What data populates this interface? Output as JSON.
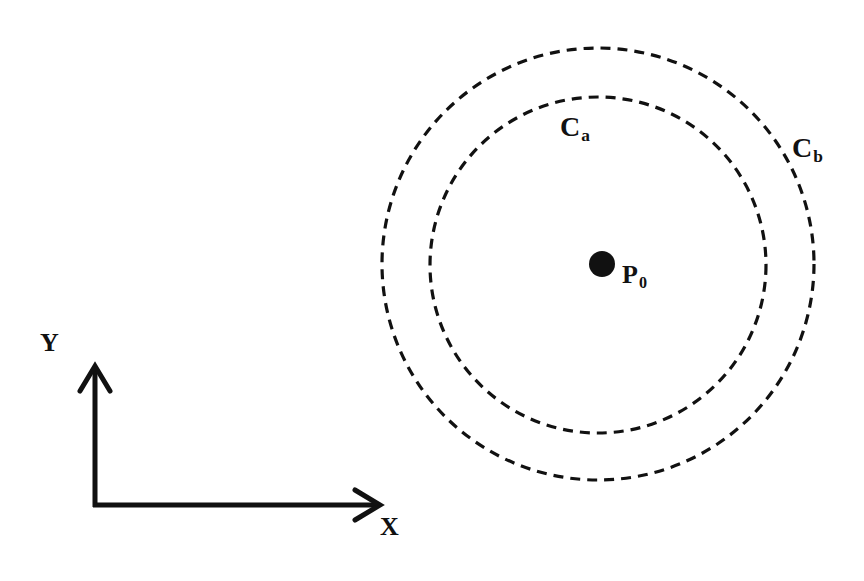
{
  "diagram": {
    "colors": {
      "ink": "#111111",
      "background": "#ffffff"
    },
    "axes": {
      "origin": {
        "x": 95,
        "y": 505
      },
      "x_axis": {
        "label": "X",
        "tip": {
          "x": 382,
          "y": 505
        }
      },
      "y_axis": {
        "label": "Y",
        "tip": {
          "x": 95,
          "y": 364
        }
      }
    },
    "point": {
      "label_main": "P",
      "label_sub": "0",
      "center": {
        "x": 602,
        "y": 264
      },
      "radius": 13
    },
    "circles": [
      {
        "id": "Ca",
        "label_main": "C",
        "label_sub": "a",
        "center": {
          "x": 598,
          "y": 265
        },
        "radius": 168,
        "style": "dashed"
      },
      {
        "id": "Cb",
        "label_main": "C",
        "label_sub": "b",
        "center": {
          "x": 598,
          "y": 264
        },
        "radius": 216,
        "style": "dashed"
      }
    ]
  }
}
